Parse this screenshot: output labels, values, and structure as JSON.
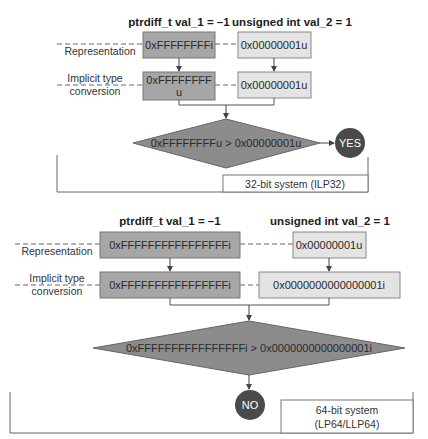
{
  "colors": {
    "dark_box": "#a6a6a6",
    "light_box": "#e3e3e3",
    "diamond": "#8c8c8c",
    "circle": "#4a4a4a",
    "line": "#555555"
  },
  "row_labels": {
    "representation": "Representation",
    "conversion_line1": "Implicit type",
    "conversion_line2": "conversion"
  },
  "system_32": {
    "heading_left": "ptrdiff_t val_1 = –1",
    "heading_right": "unsigned int val_2 = 1",
    "repr_left": "0xFFFFFFFFi",
    "repr_right": "0x00000001u",
    "conv_left_line1": "0xFFFFFFFF",
    "conv_left_line2": "u",
    "conv_right": "0x00000001u",
    "comparison": "0xFFFFFFFFu > 0x00000001u",
    "result": "YES",
    "system_label": "32-bit system (ILP32)"
  },
  "system_64": {
    "heading_left": "ptrdiff_t val_1 = –1",
    "heading_right": "unsigned int val_2 = 1",
    "repr_left": "0xFFFFFFFFFFFFFFFFi",
    "repr_right": "0x00000001u",
    "conv_left": "0xFFFFFFFFFFFFFFFFi",
    "conv_right": "0x0000000000000001i",
    "comparison": "0xFFFFFFFFFFFFFFFFi > 0x0000000000000001i",
    "result": "NO",
    "system_label_line1": "64-bit system",
    "system_label_line2": "(LP64/LLP64)"
  }
}
